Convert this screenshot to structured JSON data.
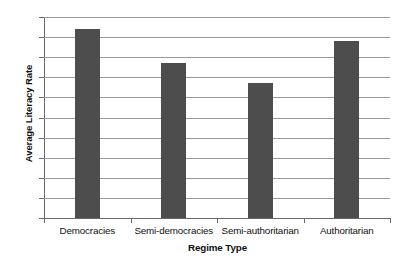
{
  "chart_data": {
    "type": "bar",
    "title": "",
    "subtitle": "",
    "xlabel": "Regime Type",
    "ylabel": "Average Literacy Rate",
    "categories": [
      "Democracies",
      "Semi-democracies",
      "Semi-authoritarian",
      "Authoritarian"
    ],
    "values": [
      94,
      77,
      67,
      88
    ],
    "series": [
      {
        "name": "Average Literacy Rate",
        "values": [
          94,
          77,
          67,
          88
        ]
      }
    ],
    "ylim": [
      0,
      100
    ],
    "ytick_labels": [
      "100",
      "90",
      "80",
      "70",
      "60",
      "50",
      "40",
      "30",
      "20",
      "10",
      "0"
    ],
    "ytick_values": [
      100,
      90,
      80,
      70,
      60,
      50,
      40,
      30,
      20,
      10,
      0
    ],
    "ytick_step": 10,
    "grid": true,
    "grid_axis": "y",
    "legend": false,
    "legend_position": "none",
    "annotations": [],
    "colors": {
      "bar_fill": "#4d4d4d",
      "gridline": "#9a9a9a",
      "axis_line": "#6a6a6a",
      "text": "#111111",
      "background": "#ffffff"
    }
  }
}
